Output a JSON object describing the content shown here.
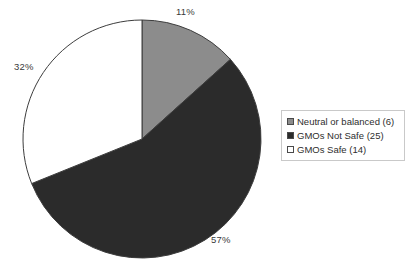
{
  "chart_data": {
    "type": "pie",
    "title": "",
    "categories": [
      "Neutral or balanced",
      "GMOs Not Safe",
      "GMOs Safe"
    ],
    "values": [
      6,
      25,
      14
    ],
    "percent_labels": [
      "11%",
      "57%",
      "32%"
    ],
    "percents": [
      11,
      57,
      32
    ],
    "total": 45,
    "colors": [
      "#8c8c8c",
      "#2b2b2b",
      "#ffffff"
    ],
    "slice_border_color": "#3d3d3d",
    "start_angle_deg": 0,
    "direction": "clockwise",
    "legend": {
      "position": "right",
      "border_color": "#c9c9c9",
      "entries": [
        {
          "label": "Neutral or balanced (6)",
          "color": "#8c8c8c"
        },
        {
          "label": "GMOs Not Safe (25)",
          "color": "#2b2b2b"
        },
        {
          "label": "GMOs Safe (14)",
          "color": "#ffffff"
        }
      ]
    },
    "grid": false,
    "xlabel": "",
    "ylabel": ""
  },
  "pie": {
    "center_x": 142,
    "center_y": 139,
    "radius": 119
  }
}
